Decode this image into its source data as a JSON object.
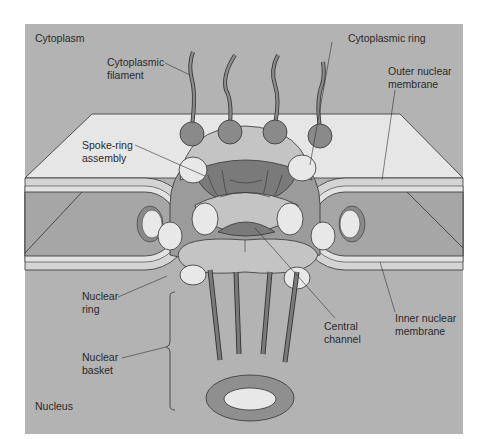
{
  "figure": {
    "colors": {
      "background": "#ffffff",
      "panel": "#b3b3b3",
      "membrane_top": "#e6e6e6",
      "membrane_edge": "#d2d2d2",
      "lumen": "#a6a6a6",
      "ring_light": "#c4c4c4",
      "ring_mid": "#9b9b9b",
      "ring_dark": "#7a7a7a",
      "oval_light": "#e8e8e8",
      "outline": "#333333"
    }
  },
  "regions": {
    "top": "Cytoplasm",
    "bottom": "Nucleus"
  },
  "labels": {
    "cytoplasmic_filament": [
      "Cytoplasmic",
      "filament"
    ],
    "cytoplasmic_ring": [
      "Cytoplasmic ring"
    ],
    "outer_nuclear_membrane": [
      "Outer nuclear",
      "membrane"
    ],
    "spoke_ring_assembly": [
      "Spoke-ring",
      "assembly"
    ],
    "nuclear_ring": [
      "Nuclear",
      "ring"
    ],
    "central_channel": [
      "Central",
      "channel"
    ],
    "inner_nuclear_membrane": [
      "Inner nuclear",
      "membrane"
    ],
    "nuclear_basket": [
      "Nuclear",
      "basket"
    ]
  }
}
